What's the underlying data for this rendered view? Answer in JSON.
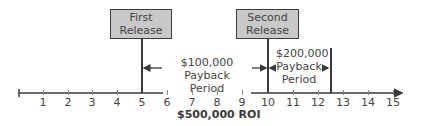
{
  "diagram": {
    "releases": [
      {
        "label_line1": "First",
        "label_line2": "Release",
        "position": 5
      },
      {
        "label_line1": "Second",
        "label_line2": "Release",
        "position": 10
      }
    ],
    "payback_periods": [
      {
        "amount": "$100,000 Payback",
        "suffix": "Period",
        "from": 5,
        "to": 10
      },
      {
        "amount": "$200,000",
        "middle": "Payback",
        "suffix": "Period",
        "from": 10,
        "to": 12.5
      }
    ],
    "axis": {
      "ticks": [
        "1",
        "2",
        "3",
        "4",
        "5",
        "6",
        "7",
        "8",
        "9",
        "10",
        "11",
        "12",
        "13",
        "14",
        "15"
      ]
    },
    "roi_label": "$500,000 ROI",
    "colors": {
      "box_fill": "#c9c9c9",
      "line": "#3a3a3a"
    }
  }
}
